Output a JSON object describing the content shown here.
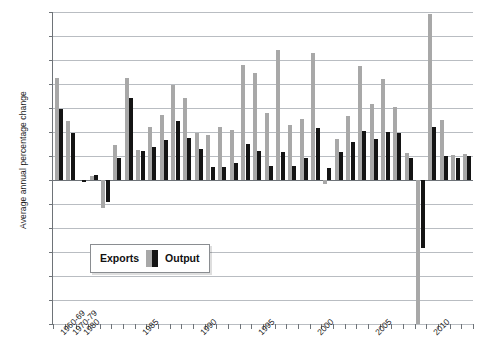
{
  "chart_data": {
    "type": "bar",
    "title": "",
    "xlabel": "",
    "ylabel": "Average annual percentage change",
    "ylim": [
      -12,
      14
    ],
    "ystep": 2,
    "grid": true,
    "legend_position": "inside-lower-left",
    "ytick_labels": [
      "14",
      "12",
      "10",
      "8",
      "6",
      "4",
      "2",
      "0",
      "-2",
      "-4",
      "-6",
      "-8",
      "-10",
      "-12"
    ],
    "xtick_labels": [
      "1960-69",
      "1970-79",
      "1980",
      "1985",
      "1990",
      "1995",
      "2000",
      "2005",
      "2010"
    ],
    "categories": [
      "1960-69",
      "1970-79",
      "1980",
      "1981",
      "1982",
      "1983",
      "1984",
      "1985",
      "1986",
      "1987",
      "1988",
      "1989",
      "1990",
      "1991",
      "1992",
      "1993",
      "1994",
      "1995",
      "1996",
      "1997",
      "1998",
      "1999",
      "2000",
      "2001",
      "2002",
      "2003",
      "2004",
      "2005",
      "2006",
      "2007",
      "2008",
      "2009",
      "2010",
      "2011",
      "2012",
      "2013"
    ],
    "series": [
      {
        "name": "Exports",
        "color": "#a8a8a8",
        "values": [
          8.5,
          4.95,
          0.0,
          0.35,
          -2.35,
          2.9,
          8.5,
          2.5,
          4.45,
          5.4,
          7.95,
          6.85,
          3.95,
          3.75,
          4.45,
          4.2,
          9.6,
          8.9,
          5.6,
          10.8,
          4.6,
          5.1,
          10.6,
          -0.3,
          3.4,
          5.3,
          9.5,
          6.3,
          8.4,
          6.1,
          2.25,
          -12.0,
          13.8,
          5.0,
          2.1,
          2.2
        ]
      },
      {
        "name": "Output",
        "color": "#141414",
        "values": [
          5.95,
          3.9,
          -0.15,
          0.45,
          -1.8,
          1.85,
          6.85,
          2.45,
          2.75,
          3.3,
          4.9,
          3.5,
          2.6,
          1.05,
          1.1,
          1.45,
          3.0,
          2.45,
          1.2,
          2.35,
          1.15,
          1.8,
          4.3,
          1.0,
          2.35,
          3.15,
          4.1,
          3.4,
          4.0,
          3.9,
          1.8,
          -5.7,
          4.4,
          2.0,
          1.8,
          2.0
        ]
      }
    ],
    "legend": [
      {
        "label": "Exports",
        "color": "#a8a8a8"
      },
      {
        "label": "Output",
        "color": "#141414"
      }
    ]
  }
}
